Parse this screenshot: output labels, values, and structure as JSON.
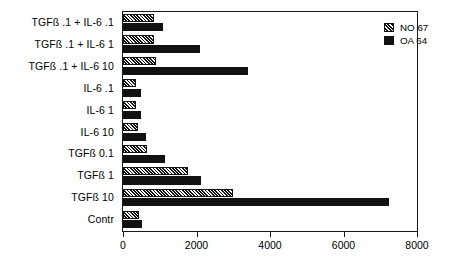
{
  "chart_data": {
    "type": "bar",
    "orientation": "horizontal",
    "title": "",
    "xlabel": "",
    "ylabel": "",
    "xlim": [
      0,
      8000
    ],
    "xticks": [
      0,
      2000,
      4000,
      6000,
      8000
    ],
    "xtick_labels": [
      "0",
      "2000",
      "4000",
      "6000",
      "8000"
    ],
    "grid": false,
    "legend_position": "top-right",
    "categories": [
      "TGFß .1 + IL-6  .1",
      "TGFß .1 + IL-6   1",
      "TGFß .1 + IL-6 10",
      "IL-6  .1",
      "IL-6   1",
      "IL-6 10",
      "TGFß  0.1",
      "TGFß   1",
      "TGFß  10",
      "Contr"
    ],
    "series": [
      {
        "name": "NO 67",
        "pattern": "hatched",
        "color": "#111111",
        "values": [
          840,
          840,
          900,
          350,
          360,
          400,
          650,
          1780,
          3000,
          430
        ]
      },
      {
        "name": "OA 64",
        "pattern": "solid",
        "color": "#111111",
        "values": [
          1080,
          2100,
          3400,
          480,
          480,
          620,
          1150,
          2130,
          7250,
          510
        ]
      }
    ]
  },
  "legend": {
    "entries": [
      {
        "label": "NO 67",
        "swatch": "hatched-swatch-icon"
      },
      {
        "label": "OA 64",
        "swatch": "solid-swatch-icon"
      }
    ]
  },
  "colors": {
    "bar": "#111111",
    "axis": "#1a1a1a",
    "background": "#ffffff",
    "text": "#000000"
  }
}
